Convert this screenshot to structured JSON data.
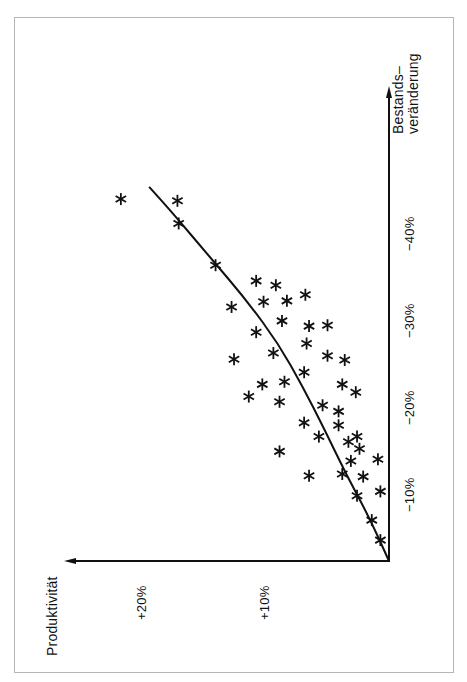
{
  "chart_data": {
    "type": "scatter",
    "orientation": "rotated-90-ccw",
    "title": "",
    "xlabel": "Bestands-\nveränderung",
    "ylabel": "Produktivität",
    "x_ticks": [
      "−10%",
      "−20%",
      "−30%",
      "−40%"
    ],
    "y_ticks": [
      "+10%",
      "+20%"
    ],
    "xlim": [
      0,
      -48
    ],
    "ylim": [
      0,
      26
    ],
    "grid": false,
    "legend": null,
    "marker": "asterisk",
    "series": [
      {
        "name": "Observations",
        "points": [
          {
            "x": -41.6,
            "y": 21.8
          },
          {
            "x": -41.4,
            "y": 17.2
          },
          {
            "x": -38.8,
            "y": 17.1
          },
          {
            "x": -34.0,
            "y": 14.1
          },
          {
            "x": -32.2,
            "y": 10.8
          },
          {
            "x": -31.7,
            "y": 9.2
          },
          {
            "x": -29.8,
            "y": 10.2
          },
          {
            "x": -29.9,
            "y": 8.3
          },
          {
            "x": -30.6,
            "y": 6.8
          },
          {
            "x": -29.2,
            "y": 12.8
          },
          {
            "x": -26.3,
            "y": 10.8
          },
          {
            "x": -27.6,
            "y": 8.7
          },
          {
            "x": -27.0,
            "y": 6.5
          },
          {
            "x": -27.1,
            "y": 5.0
          },
          {
            "x": -25.0,
            "y": 6.7
          },
          {
            "x": -23.9,
            "y": 9.4
          },
          {
            "x": -23.2,
            "y": 12.6
          },
          {
            "x": -23.6,
            "y": 5.0
          },
          {
            "x": -23.1,
            "y": 3.6
          },
          {
            "x": -21.7,
            "y": 6.9
          },
          {
            "x": -20.6,
            "y": 8.5
          },
          {
            "x": -18.9,
            "y": 11.4
          },
          {
            "x": -18.3,
            "y": 8.9
          },
          {
            "x": -17.9,
            "y": 5.4
          },
          {
            "x": -19.4,
            "y": 2.7
          },
          {
            "x": -20.3,
            "y": 3.8
          },
          {
            "x": -20.3,
            "y": 10.3
          },
          {
            "x": -15.9,
            "y": 6.9
          },
          {
            "x": -17.2,
            "y": 4.1
          },
          {
            "x": -15.6,
            "y": 4.1
          },
          {
            "x": -14.3,
            "y": 5.7
          },
          {
            "x": -14.3,
            "y": 2.6
          },
          {
            "x": -12.6,
            "y": 8.9
          },
          {
            "x": -13.7,
            "y": 3.3
          },
          {
            "x": -12.9,
            "y": 2.4
          },
          {
            "x": -11.7,
            "y": 0.9
          },
          {
            "x": -11.5,
            "y": 3.1
          },
          {
            "x": -9.8,
            "y": 6.5
          },
          {
            "x": -9.7,
            "y": 2.1
          },
          {
            "x": -10.0,
            "y": 3.8
          },
          {
            "x": -8.0,
            "y": 0.7
          },
          {
            "x": -7.5,
            "y": 2.6
          },
          {
            "x": -4.7,
            "y": 1.4
          },
          {
            "x": -2.4,
            "y": 0.7
          }
        ]
      },
      {
        "name": "Trend",
        "type": "line",
        "points": [
          {
            "x": 0,
            "y": 0
          },
          {
            "x": -5,
            "y": 1.6
          },
          {
            "x": -10,
            "y": 3.5
          },
          {
            "x": -15,
            "y": 5.2
          },
          {
            "x": -20,
            "y": 7.0
          },
          {
            "x": -25,
            "y": 9.0
          },
          {
            "x": -30,
            "y": 11.6
          },
          {
            "x": -35,
            "y": 14.6
          },
          {
            "x": -40,
            "y": 17.6
          },
          {
            "x": -43,
            "y": 19.5
          }
        ]
      }
    ],
    "annotations": []
  },
  "labels": {
    "x_axis_title_line1": "Bestands–",
    "x_axis_title_line2": "veränderung",
    "y_axis_title": "Produktivität",
    "x_tick_10": "−10%",
    "x_tick_20": "−20%",
    "x_tick_30": "−30%",
    "x_tick_40": "−40%",
    "y_tick_10": "+10%",
    "y_tick_20": "+20%"
  },
  "colors": {
    "ink": "#111111",
    "frame": "#b5b5b5",
    "background": "#ffffff"
  }
}
